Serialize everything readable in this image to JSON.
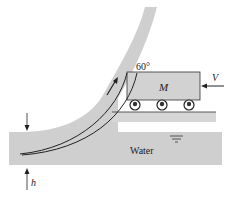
{
  "diagram": {
    "labels": {
      "angle": "60°",
      "mass": "M",
      "velocity": "V",
      "water": "Water",
      "height": "h"
    },
    "colors": {
      "fluid": "#cfcfcf",
      "cart": "#d2d2d2",
      "ground": "#d6d6d6",
      "stroke": "#222222"
    }
  }
}
